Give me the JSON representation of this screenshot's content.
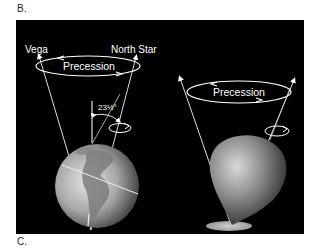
{
  "labels": {
    "top": "B.",
    "bottom": "C."
  },
  "figure": {
    "background": "#000000",
    "left_diagram": {
      "subject": "Earth",
      "star_left": "Vega",
      "star_right": "North Star",
      "precession_label": "Precession",
      "tilt_angle": "23½°"
    },
    "right_diagram": {
      "subject": "spinning-top",
      "precession_label": "Precession"
    }
  }
}
